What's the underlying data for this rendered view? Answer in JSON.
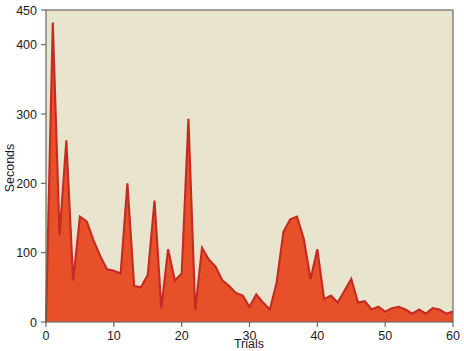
{
  "chart_data": {
    "type": "area",
    "title": "",
    "subtitle": "",
    "xlabel": "Trials",
    "ylabel": "Seconds",
    "xlim": [
      0,
      60
    ],
    "ylim": [
      0,
      450
    ],
    "grid": false,
    "legend": null,
    "xticks": [
      0,
      10,
      20,
      30,
      40,
      50,
      60
    ],
    "xtick_labels": [
      "0",
      "10",
      "20",
      "30",
      "40",
      "50",
      "60"
    ],
    "yticks": [
      0,
      100,
      200,
      300,
      400,
      450
    ],
    "ytick_labels": [
      "0",
      "100",
      "200",
      "300",
      "400",
      "450"
    ],
    "plot_background": "#E8E4CE",
    "fill_color": "#E8502A",
    "line_color": "#C42B22",
    "axis_color": "#6b6a60",
    "series": [
      {
        "name": "Seconds per trial",
        "x": [
          0,
          1,
          2,
          3,
          4,
          5,
          6,
          7,
          8,
          9,
          10,
          11,
          12,
          13,
          14,
          15,
          16,
          17,
          18,
          19,
          20,
          21,
          22,
          23,
          24,
          25,
          26,
          27,
          28,
          29,
          30,
          31,
          32,
          33,
          34,
          35,
          36,
          37,
          38,
          39,
          40,
          41,
          42,
          43,
          44,
          45,
          46,
          47,
          48,
          49,
          50,
          51,
          52,
          53,
          54,
          55,
          56,
          57,
          58,
          59,
          60
        ],
        "values": [
          0,
          432,
          125,
          262,
          60,
          152,
          145,
          118,
          95,
          76,
          74,
          70,
          200,
          52,
          50,
          68,
          175,
          20,
          105,
          60,
          70,
          293,
          17,
          107,
          90,
          80,
          60,
          52,
          42,
          38,
          22,
          40,
          28,
          18,
          57,
          130,
          148,
          152,
          120,
          62,
          105,
          33,
          38,
          28,
          45,
          62,
          28,
          30,
          18,
          22,
          15,
          20,
          22,
          18,
          12,
          18,
          12,
          20,
          18,
          12,
          15
        ]
      }
    ]
  },
  "axis": {
    "y_title": "Seconds",
    "x_title": "Trials"
  }
}
